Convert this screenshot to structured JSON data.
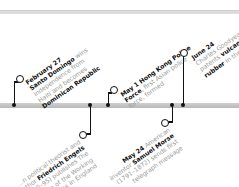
{
  "timeline": {
    "events": [
      {
        "position": "above",
        "date": "February 27",
        "lines": [
          {
            "pre": "",
            "em": "Santo Domingo",
            "post": " wins"
          },
          {
            "pre": "independence from",
            "em": "",
            "post": ""
          },
          {
            "pre": "Haiti and becomes",
            "em": "",
            "post": ""
          },
          {
            "pre": "",
            "em": "Dominican Republic",
            "post": ""
          }
        ]
      },
      {
        "position": "below",
        "date": "",
        "lines": [
          {
            "pre": "...n political theorist and",
            "em": "",
            "post": ""
          },
          {
            "pre": "author ",
            "em": "Friedrich Engels",
            "post": ""
          },
          {
            "pre": "(1820–95) publishes ",
            "em": "",
            "post": "The"
          },
          {
            "pre": "Condition of the Working",
            "em": "",
            "post": ""
          },
          {
            "pre": "Class in England",
            "em": "",
            "post": ""
          }
        ]
      },
      {
        "position": "above",
        "date": "May 1",
        "lines": [
          {
            "pre": "",
            "em": "Hong Kong Police",
            "post": ""
          },
          {
            "pre": "",
            "em": "Force",
            "post": ", first Asian police"
          },
          {
            "pre": "force, formed",
            "em": "",
            "post": ""
          }
        ]
      },
      {
        "position": "below",
        "date": "May 24",
        "lines": [
          {
            "pre": "American",
            "em": "",
            "post": ""
          },
          {
            "pre": "inventor ",
            "em": "Samuel Morse",
            "post": ""
          },
          {
            "pre": "(1791–1872) sends first",
            "em": "",
            "post": ""
          },
          {
            "pre": "telegraph message",
            "em": "",
            "post": ""
          }
        ]
      },
      {
        "position": "above",
        "date": "June 24",
        "lines": [
          {
            "pre": "Charles Goodyear",
            "em": "",
            "post": ""
          },
          {
            "pre": "patents ",
            "em": "vulcanized",
            "post": ""
          },
          {
            "pre": "",
            "em": "rubber",
            "post": " in the..."
          }
        ]
      }
    ]
  }
}
